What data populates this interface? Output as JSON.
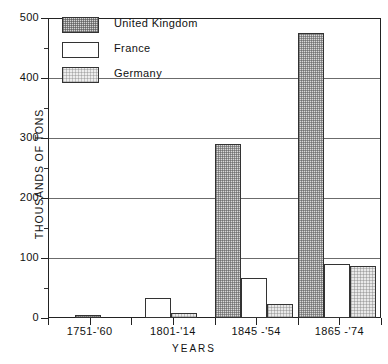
{
  "chart_data": {
    "type": "bar",
    "title": "",
    "subtitle": "",
    "xlabel": "YEARS",
    "ylabel": "THOUSANDS OF TONS",
    "categories": [
      "1751-'60",
      "1801-'14",
      "1845 -'54",
      "1865 -'74"
    ],
    "series": [
      {
        "name": "United Kingdom",
        "values": [
          5,
          0,
          290,
          475
        ]
      },
      {
        "name": "France",
        "values": [
          0,
          33,
          67,
          90
        ]
      },
      {
        "name": "Germany",
        "values": [
          0,
          9,
          23,
          86
        ]
      }
    ],
    "ylim": [
      0,
      500
    ],
    "ytick_labels": [
      "0",
      "100",
      "200",
      "300",
      "400",
      "500"
    ],
    "ytick_values": [
      0,
      100,
      200,
      300,
      400,
      500
    ],
    "yminor_values": [
      50,
      150,
      250,
      350,
      450
    ],
    "grid": "horizontal-major",
    "legend_position": "top-left",
    "legend": [
      {
        "label": "United Kingdom",
        "swatch": "dark-stipple"
      },
      {
        "label": "France",
        "swatch": "white"
      },
      {
        "label": "Germany",
        "swatch": "light-stipple"
      }
    ],
    "colors": {
      "uk_fill": "#d9d9d9",
      "france_fill": "#ffffff",
      "germany_fill": "#e9e9e9",
      "axis": "#222222",
      "gridline": "#6b6b6b",
      "background": "#ffffff"
    }
  }
}
